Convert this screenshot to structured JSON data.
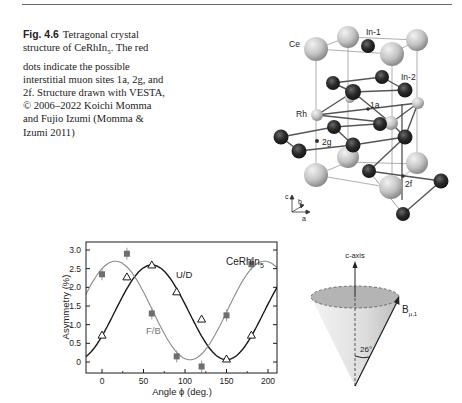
{
  "caption": {
    "figure_number": "Fig. 4.6",
    "text_before_sub": "Tetragonal crystal structure of CeRhIn",
    "subscript": "5",
    "text_after_sub": ". The red dots indicate the possible interstitial muon sites 1a, 2g, and 2f. Structure drawn with VESTA, © 2006–2022 Koichi Momma and Fujio Izumi (Momma & Izumi 2011)"
  },
  "structure": {
    "atom_labels": {
      "ce": "Ce",
      "in1": "In-1",
      "in2": "In-2",
      "rh": "Rh"
    },
    "site_labels": {
      "s1a": "1a",
      "s2g": "2g",
      "s2f": "2f"
    },
    "axes": {
      "c": "c",
      "b": "b",
      "a": "a"
    },
    "colors": {
      "ce": "#c8c8c8",
      "in": "#2a2a2a",
      "rh": "#cfcfcf",
      "bond": "#555555",
      "cell": "#9a9a9a",
      "site": "#333333"
    }
  },
  "chart_data": {
    "type": "scatter",
    "title": "CeRhIn",
    "title_subscript": "5",
    "xlabel": "Angle ϕ (deg.)",
    "ylabel": "Asymmetry (%)",
    "xlim": [
      -20,
      210
    ],
    "ylim": [
      -0.2,
      3.2
    ],
    "xticks": [
      0,
      50,
      100,
      150,
      200
    ],
    "yticks": [
      0,
      0.5,
      1.0,
      1.5,
      2.0,
      2.5,
      3.0
    ],
    "ytick_labels": [
      "0",
      "0.5",
      "1.0",
      "1.5",
      "2.0",
      "2.5",
      "3.0"
    ],
    "grid": false,
    "series": [
      {
        "name": "U/D",
        "marker": "open-triangle",
        "color": "#1a1a1a",
        "x": [
          0,
          30,
          60,
          90,
          120,
          150,
          180
        ],
        "y": [
          0.72,
          2.28,
          2.6,
          1.88,
          1.15,
          0.08,
          0.72
        ],
        "fit": {
          "offset": 1.33,
          "amplitude": 1.27,
          "phase_deg_max": 60,
          "period_deg": 180
        }
      },
      {
        "name": "F/B",
        "marker": "filled-square",
        "color": "#7a7a7a",
        "x": [
          0,
          30,
          60,
          90,
          120,
          150,
          180
        ],
        "y": [
          2.35,
          2.9,
          1.3,
          0.15,
          -0.12,
          1.25,
          2.62
        ],
        "fit": {
          "offset": 1.38,
          "amplitude": 1.32,
          "phase_deg_max": 16,
          "period_deg": 180
        }
      }
    ],
    "annotations": [
      "U/D",
      "F/B"
    ]
  },
  "cone": {
    "axis_label": "c-axis",
    "field_label": "B",
    "field_subscript": "μ,1",
    "angle_label": "26°"
  }
}
